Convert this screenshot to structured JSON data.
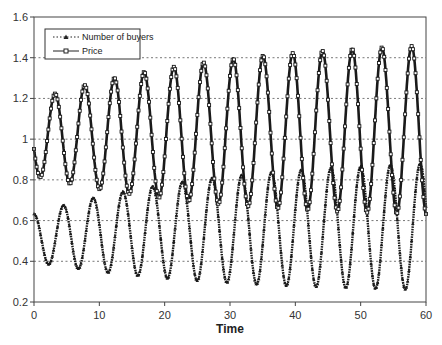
{
  "chart_data": {
    "type": "line",
    "title": "",
    "xlabel": "Time",
    "ylabel": "",
    "xlim": [
      0,
      60
    ],
    "ylim": [
      0.2,
      1.6
    ],
    "x_ticks": [
      0,
      10,
      20,
      30,
      40,
      50,
      60
    ],
    "x_tick_labels": [
      "0",
      "10",
      "20",
      "30",
      "40",
      "50",
      "60"
    ],
    "y_ticks": [
      0.2,
      0.4,
      0.6,
      0.8,
      1.0,
      1.2,
      1.4,
      1.6
    ],
    "y_tick_labels": [
      "0.2",
      "0.4",
      "0.6",
      "0.8",
      "1",
      "1.2",
      "1.4",
      "1.6"
    ],
    "grid": {
      "horizontal": true,
      "vertical": false,
      "style": "dotted"
    },
    "legend": {
      "position": "upper-left",
      "entries": [
        "Number of buyers",
        "Price"
      ]
    },
    "period": 4.55,
    "series": [
      {
        "name": "Number of buyers",
        "line_style": "dotted",
        "marker": "triangle",
        "model": {
          "center_start": 0.515,
          "center_end": 0.57,
          "amp_start": 0.118,
          "amp_end": 0.31,
          "phase_peak_t": 4.5
        },
        "peaks": [
          [
            4.5,
            0.63
          ],
          [
            9.0,
            0.66
          ],
          [
            13.5,
            0.7
          ],
          [
            18.0,
            0.74
          ],
          [
            22.6,
            0.78
          ],
          [
            27.1,
            0.81
          ],
          [
            31.7,
            0.83
          ],
          [
            36.2,
            0.85
          ],
          [
            40.8,
            0.86
          ],
          [
            45.3,
            0.87
          ],
          [
            49.9,
            0.88
          ],
          [
            54.4,
            0.89
          ],
          [
            59.0,
            0.89
          ]
        ],
        "troughs": [
          [
            0.2,
            0.4
          ],
          [
            6.8,
            0.38
          ],
          [
            11.3,
            0.35
          ],
          [
            15.8,
            0.33
          ],
          [
            20.3,
            0.31
          ],
          [
            24.9,
            0.29
          ],
          [
            29.4,
            0.28
          ],
          [
            33.9,
            0.27
          ],
          [
            38.5,
            0.27
          ],
          [
            43.1,
            0.26
          ],
          [
            47.6,
            0.26
          ],
          [
            52.2,
            0.26
          ],
          [
            56.7,
            0.26
          ]
        ]
      },
      {
        "name": "Price",
        "line_style": "solid",
        "marker": "square",
        "model": {
          "center_start": 1.005,
          "center_end": 1.045,
          "amp_start": 0.185,
          "amp_end": 0.415,
          "phase_peak_t": 3.2
        },
        "peaks": [
          [
            3.2,
            1.19
          ],
          [
            7.8,
            1.22
          ],
          [
            12.3,
            1.26
          ],
          [
            16.8,
            1.3
          ],
          [
            21.4,
            1.34
          ],
          [
            25.9,
            1.37
          ],
          [
            30.5,
            1.4
          ],
          [
            35.0,
            1.41
          ],
          [
            39.6,
            1.42
          ],
          [
            44.1,
            1.43
          ],
          [
            48.7,
            1.44
          ],
          [
            53.3,
            1.45
          ],
          [
            57.8,
            1.45
          ]
        ],
        "troughs": [
          [
            1.2,
            0.83
          ],
          [
            5.5,
            0.79
          ],
          [
            10.0,
            0.76
          ],
          [
            14.6,
            0.73
          ],
          [
            19.1,
            0.7
          ],
          [
            23.7,
            0.67
          ],
          [
            28.2,
            0.66
          ],
          [
            32.8,
            0.64
          ],
          [
            37.3,
            0.63
          ],
          [
            41.9,
            0.62
          ],
          [
            46.4,
            0.62
          ],
          [
            51.0,
            0.61
          ],
          [
            55.5,
            0.6
          ]
        ],
        "start_value": 1.05
      }
    ]
  },
  "colors": {
    "axis": "#444444",
    "grid": "#555555",
    "series": "#1a1a1a",
    "background": "#ffffff"
  }
}
